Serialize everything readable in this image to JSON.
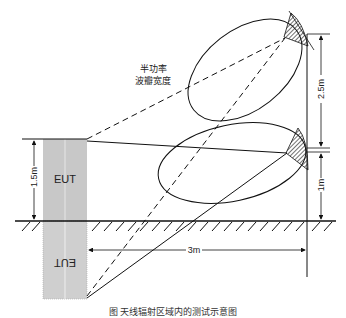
{
  "labels": {
    "beam_line1": "半功率",
    "beam_line2": "波瓣宽度",
    "eut": "EUT",
    "eut_mirror": "EUT",
    "height_eut": "1.5m",
    "height_upper": "2.5m",
    "height_lower": "1m",
    "distance": "3m"
  },
  "caption": "图 天线辐射区域内的测试示意图",
  "colors": {
    "line": "#111111",
    "eut_fill": "#c8c8c8",
    "mirror_fill": "#cfcfcf",
    "background": "#ffffff"
  }
}
